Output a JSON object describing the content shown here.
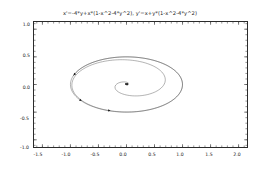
{
  "chart_data": {
    "type": "line",
    "subtype": "streamplot",
    "title": "x'=-4*y+x*(1-x^2-4*y^2), y'=x+y*(1-x^2-4*y^2)",
    "xlabel": "",
    "ylabel": "",
    "xlim": [
      -1.65,
      2.15
    ],
    "ylim": [
      -1.13,
      1.13
    ],
    "xticks": [
      -1.5,
      -1.0,
      -0.5,
      0.0,
      0.5,
      1.0,
      1.5,
      2.0
    ],
    "xticklabels": [
      "-1.5",
      "-1.0",
      "-0.5",
      "0.0",
      "0.5",
      "1.0",
      "1.5",
      "2.0"
    ],
    "yticks": [
      -1.0,
      -0.5,
      0.0,
      0.5,
      1.0
    ],
    "yticklabels": [
      "-1.0",
      "-0.5",
      "0.0",
      "0.5",
      "1.0"
    ],
    "grid": false,
    "legend": null,
    "line_color": "#555555",
    "arrow_color": "#1a1a1a",
    "frame_color": "#2b2b2b",
    "background": "#ffffff",
    "equations": {
      "dx": "-4*y+x*(1-x^2-4*y^2)",
      "dy": "x+y*(1-x^2-4*y^2)"
    },
    "fixed_point": [
      0.0,
      0.0
    ],
    "limit_cycle": {
      "center": [
        0.0,
        0.0
      ],
      "semi_axis_x": 1.0,
      "semi_axis_y": 0.5
    }
  }
}
